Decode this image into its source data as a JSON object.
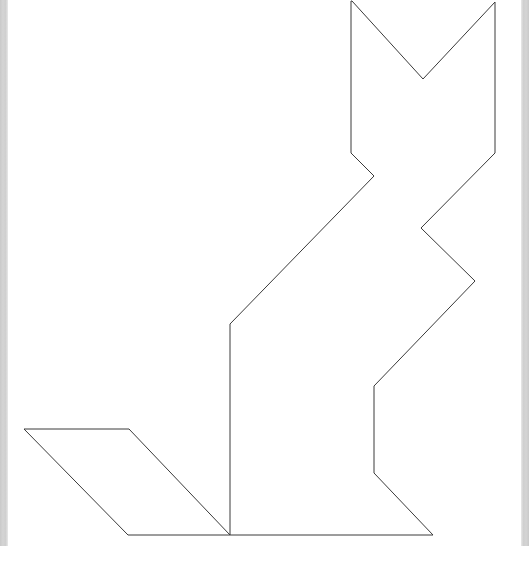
{
  "page": {
    "width": 529,
    "height": 563,
    "background_color": "#ffffff"
  },
  "chrome": {
    "left_scroll_strip": {
      "name": "left-edge-strip",
      "color": "#cccccc",
      "x": 0,
      "width": 8,
      "height": 546
    },
    "right_scroll_strip": {
      "name": "right-edge-strip",
      "color": "#cccccc",
      "x": 521,
      "width": 8,
      "height": 546
    }
  },
  "figure": {
    "name": "tangram-cat-silhouette",
    "stroke_color": "#3a3a3a",
    "fill_color": "#ffffff",
    "stroke_width": 1,
    "shapes": [
      {
        "name": "cat-body-outline",
        "type": "polygon",
        "closed": true,
        "points": [
          [
            352,
            1
          ],
          [
            423,
            79
          ],
          [
            495,
            2
          ],
          [
            495,
            153
          ],
          [
            421,
            228
          ],
          [
            475,
            281
          ],
          [
            374,
            386
          ],
          [
            374,
            473
          ],
          [
            433,
            535
          ],
          [
            230,
            535
          ],
          [
            230,
            324
          ],
          [
            374,
            176
          ],
          [
            351,
            153
          ],
          [
            351,
            1
          ]
        ]
      },
      {
        "name": "cat-tail-parallelogram",
        "type": "polygon",
        "closed": true,
        "points": [
          [
            24,
            429
          ],
          [
            129,
            429
          ],
          [
            230,
            535
          ],
          [
            128,
            535
          ]
        ]
      }
    ],
    "anchor_points": [
      {
        "name": "left-ear-tip",
        "x": 352,
        "y": 1
      },
      {
        "name": "ear-notch-vertex",
        "x": 423,
        "y": 79
      },
      {
        "name": "right-ear-tip",
        "x": 495,
        "y": 2
      },
      {
        "name": "head-right-corner",
        "x": 495,
        "y": 153
      },
      {
        "name": "back-inner-notch",
        "x": 421,
        "y": 228
      },
      {
        "name": "back-outer-point",
        "x": 475,
        "y": 281
      },
      {
        "name": "haunch-top-corner",
        "x": 374,
        "y": 386
      },
      {
        "name": "haunch-bottom-corner",
        "x": 374,
        "y": 473
      },
      {
        "name": "rear-foot-point",
        "x": 433,
        "y": 535
      },
      {
        "name": "front-foot-point",
        "x": 230,
        "y": 535
      },
      {
        "name": "chest-top-corner",
        "x": 230,
        "y": 324
      },
      {
        "name": "shoulder-peak",
        "x": 374,
        "y": 176
      },
      {
        "name": "neck-left-corner",
        "x": 351,
        "y": 153
      },
      {
        "name": "tail-left-tip",
        "x": 24,
        "y": 429
      },
      {
        "name": "tail-top-right",
        "x": 129,
        "y": 429
      },
      {
        "name": "tail-bottom-left",
        "x": 128,
        "y": 535
      }
    ]
  }
}
